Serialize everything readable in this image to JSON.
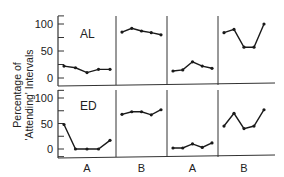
{
  "chart_data": {
    "type": "line",
    "title": "",
    "ylabel": "Percentage of 'Attending' Intervals",
    "ylabel_line1": "Percentage of",
    "ylabel_line2": "'Attending' Intervals",
    "xlabel": "",
    "ylim": [
      0,
      100
    ],
    "yticks": [
      0,
      50,
      100
    ],
    "ytick_labels": [
      "0",
      "50",
      "100"
    ],
    "phases": [
      "A",
      "B",
      "A",
      "B"
    ],
    "sessions_per_phase": 5,
    "grid": false,
    "legend": null,
    "panels": [
      {
        "subject": "AL",
        "series": [
          {
            "phase": "A",
            "values": [
              22,
              19,
              10,
              16,
              16
            ]
          },
          {
            "phase": "B",
            "values": [
              85,
              92,
              87,
              84,
              80
            ]
          },
          {
            "phase": "A",
            "values": [
              13,
              15,
              30,
              22,
              18
            ]
          },
          {
            "phase": "B",
            "values": [
              84,
              90,
              57,
              57,
              100
            ]
          }
        ]
      },
      {
        "subject": "ED",
        "series": [
          {
            "phase": "A",
            "values": [
              48,
              0,
              0,
              0,
              17
            ]
          },
          {
            "phase": "B",
            "values": [
              68,
              73,
              73,
              67,
              77
            ]
          },
          {
            "phase": "A",
            "values": [
              2,
              2,
              10,
              3,
              12
            ]
          },
          {
            "phase": "B",
            "values": [
              45,
              70,
              40,
              45,
              77
            ]
          }
        ]
      }
    ]
  },
  "colors": {
    "line": "#1a1a1a",
    "axis": "#333333",
    "background": "#ffffff"
  }
}
